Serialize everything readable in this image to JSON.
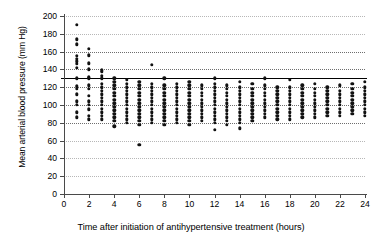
{
  "chart_data": {
    "type": "scatter",
    "title": "",
    "xlabel": "Time after initiation of antihypertensive treatment (hours)",
    "ylabel": "Mean arterial blood pressure (mm Hg)",
    "xlim": [
      0,
      24
    ],
    "ylim": [
      0,
      200
    ],
    "xticks": [
      0,
      2,
      4,
      6,
      8,
      10,
      12,
      14,
      16,
      18,
      20,
      22,
      24
    ],
    "yticks": [
      0,
      20,
      40,
      60,
      80,
      100,
      120,
      140,
      160,
      180,
      200
    ],
    "grid": "horizontal-dotted",
    "legend": "none",
    "reference_line": {
      "y": 130,
      "style": "solid",
      "color": "#000000"
    },
    "marker": {
      "shape": "circle",
      "color": "#111111",
      "size": 3.4
    },
    "series": [
      {
        "name": "Mean arterial blood pressure measurements",
        "points": [
          [
            1,
            190
          ],
          [
            1,
            174
          ],
          [
            1,
            168
          ],
          [
            1,
            155
          ],
          [
            1,
            152
          ],
          [
            1,
            149
          ],
          [
            1,
            146
          ],
          [
            1,
            142
          ],
          [
            1,
            130
          ],
          [
            1,
            121
          ],
          [
            1,
            118
          ],
          [
            1,
            112
          ],
          [
            1,
            104
          ],
          [
            1,
            100
          ],
          [
            1,
            92
          ],
          [
            1,
            86
          ],
          [
            2,
            163
          ],
          [
            2,
            156
          ],
          [
            2,
            147
          ],
          [
            2,
            140
          ],
          [
            2,
            131
          ],
          [
            2,
            130
          ],
          [
            2,
            122
          ],
          [
            2,
            118
          ],
          [
            2,
            110
          ],
          [
            2,
            104
          ],
          [
            2,
            100
          ],
          [
            2,
            95
          ],
          [
            2,
            88
          ],
          [
            2,
            84
          ],
          [
            3,
            139
          ],
          [
            3,
            137
          ],
          [
            3,
            133
          ],
          [
            3,
            130
          ],
          [
            3,
            124
          ],
          [
            3,
            120
          ],
          [
            3,
            116
          ],
          [
            3,
            112
          ],
          [
            3,
            108
          ],
          [
            3,
            104
          ],
          [
            3,
            100
          ],
          [
            3,
            96
          ],
          [
            3,
            92
          ],
          [
            3,
            88
          ],
          [
            3,
            84
          ],
          [
            4,
            130
          ],
          [
            4,
            126
          ],
          [
            4,
            122
          ],
          [
            4,
            118
          ],
          [
            4,
            114
          ],
          [
            4,
            110
          ],
          [
            4,
            106
          ],
          [
            4,
            102
          ],
          [
            4,
            98
          ],
          [
            4,
            94
          ],
          [
            4,
            90
          ],
          [
            4,
            86
          ],
          [
            4,
            82
          ],
          [
            4,
            76
          ],
          [
            5,
            128
          ],
          [
            5,
            124
          ],
          [
            5,
            120
          ],
          [
            5,
            116
          ],
          [
            5,
            112
          ],
          [
            5,
            108
          ],
          [
            5,
            104
          ],
          [
            5,
            100
          ],
          [
            5,
            96
          ],
          [
            5,
            92
          ],
          [
            5,
            88
          ],
          [
            5,
            84
          ],
          [
            5,
            80
          ],
          [
            6,
            126
          ],
          [
            6,
            122
          ],
          [
            6,
            118
          ],
          [
            6,
            114
          ],
          [
            6,
            110
          ],
          [
            6,
            106
          ],
          [
            6,
            102
          ],
          [
            6,
            98
          ],
          [
            6,
            94
          ],
          [
            6,
            90
          ],
          [
            6,
            86
          ],
          [
            6,
            82
          ],
          [
            6,
            78
          ],
          [
            6,
            55
          ],
          [
            7,
            145
          ],
          [
            7,
            124
          ],
          [
            7,
            120
          ],
          [
            7,
            116
          ],
          [
            7,
            112
          ],
          [
            7,
            108
          ],
          [
            7,
            104
          ],
          [
            7,
            100
          ],
          [
            7,
            96
          ],
          [
            7,
            92
          ],
          [
            7,
            88
          ],
          [
            7,
            84
          ],
          [
            7,
            80
          ],
          [
            8,
            130
          ],
          [
            8,
            122
          ],
          [
            8,
            118
          ],
          [
            8,
            114
          ],
          [
            8,
            110
          ],
          [
            8,
            106
          ],
          [
            8,
            102
          ],
          [
            8,
            98
          ],
          [
            8,
            94
          ],
          [
            8,
            90
          ],
          [
            8,
            86
          ],
          [
            8,
            82
          ],
          [
            8,
            78
          ],
          [
            9,
            124
          ],
          [
            9,
            120
          ],
          [
            9,
            116
          ],
          [
            9,
            112
          ],
          [
            9,
            108
          ],
          [
            9,
            104
          ],
          [
            9,
            100
          ],
          [
            9,
            96
          ],
          [
            9,
            92
          ],
          [
            9,
            88
          ],
          [
            9,
            84
          ],
          [
            9,
            80
          ],
          [
            10,
            126
          ],
          [
            10,
            122
          ],
          [
            10,
            118
          ],
          [
            10,
            114
          ],
          [
            10,
            110
          ],
          [
            10,
            106
          ],
          [
            10,
            102
          ],
          [
            10,
            98
          ],
          [
            10,
            94
          ],
          [
            10,
            90
          ],
          [
            10,
            86
          ],
          [
            10,
            82
          ],
          [
            10,
            78
          ],
          [
            11,
            122
          ],
          [
            11,
            118
          ],
          [
            11,
            114
          ],
          [
            11,
            110
          ],
          [
            11,
            106
          ],
          [
            11,
            102
          ],
          [
            11,
            98
          ],
          [
            11,
            94
          ],
          [
            11,
            90
          ],
          [
            11,
            86
          ],
          [
            11,
            82
          ],
          [
            12,
            130
          ],
          [
            12,
            124
          ],
          [
            12,
            120
          ],
          [
            12,
            116
          ],
          [
            12,
            112
          ],
          [
            12,
            108
          ],
          [
            12,
            104
          ],
          [
            12,
            100
          ],
          [
            12,
            96
          ],
          [
            12,
            92
          ],
          [
            12,
            88
          ],
          [
            12,
            84
          ],
          [
            12,
            80
          ],
          [
            12,
            72
          ],
          [
            13,
            122
          ],
          [
            13,
            118
          ],
          [
            13,
            114
          ],
          [
            13,
            110
          ],
          [
            13,
            106
          ],
          [
            13,
            102
          ],
          [
            13,
            98
          ],
          [
            13,
            94
          ],
          [
            13,
            90
          ],
          [
            13,
            86
          ],
          [
            13,
            82
          ],
          [
            13,
            78
          ],
          [
            14,
            126
          ],
          [
            14,
            120
          ],
          [
            14,
            116
          ],
          [
            14,
            112
          ],
          [
            14,
            108
          ],
          [
            14,
            104
          ],
          [
            14,
            100
          ],
          [
            14,
            96
          ],
          [
            14,
            92
          ],
          [
            14,
            88
          ],
          [
            14,
            84
          ],
          [
            14,
            80
          ],
          [
            14,
            74
          ],
          [
            15,
            124
          ],
          [
            15,
            118
          ],
          [
            15,
            114
          ],
          [
            15,
            110
          ],
          [
            15,
            106
          ],
          [
            15,
            102
          ],
          [
            15,
            98
          ],
          [
            15,
            94
          ],
          [
            15,
            90
          ],
          [
            15,
            86
          ],
          [
            15,
            82
          ],
          [
            16,
            130
          ],
          [
            16,
            122
          ],
          [
            16,
            118
          ],
          [
            16,
            114
          ],
          [
            16,
            110
          ],
          [
            16,
            106
          ],
          [
            16,
            102
          ],
          [
            16,
            98
          ],
          [
            16,
            94
          ],
          [
            16,
            90
          ],
          [
            16,
            86
          ],
          [
            17,
            120
          ],
          [
            17,
            116
          ],
          [
            17,
            112
          ],
          [
            17,
            108
          ],
          [
            17,
            104
          ],
          [
            17,
            100
          ],
          [
            17,
            96
          ],
          [
            17,
            92
          ],
          [
            17,
            88
          ],
          [
            17,
            84
          ],
          [
            18,
            128
          ],
          [
            18,
            120
          ],
          [
            18,
            116
          ],
          [
            18,
            112
          ],
          [
            18,
            108
          ],
          [
            18,
            104
          ],
          [
            18,
            100
          ],
          [
            18,
            96
          ],
          [
            18,
            92
          ],
          [
            18,
            88
          ],
          [
            18,
            84
          ],
          [
            19,
            122
          ],
          [
            19,
            118
          ],
          [
            19,
            114
          ],
          [
            19,
            110
          ],
          [
            19,
            106
          ],
          [
            19,
            102
          ],
          [
            19,
            98
          ],
          [
            19,
            94
          ],
          [
            19,
            90
          ],
          [
            19,
            86
          ],
          [
            20,
            124
          ],
          [
            20,
            118
          ],
          [
            20,
            114
          ],
          [
            20,
            110
          ],
          [
            20,
            106
          ],
          [
            20,
            102
          ],
          [
            20,
            98
          ],
          [
            20,
            94
          ],
          [
            20,
            90
          ],
          [
            20,
            86
          ],
          [
            21,
            120
          ],
          [
            21,
            116
          ],
          [
            21,
            112
          ],
          [
            21,
            108
          ],
          [
            21,
            104
          ],
          [
            21,
            100
          ],
          [
            21,
            96
          ],
          [
            21,
            92
          ],
          [
            21,
            88
          ],
          [
            22,
            122
          ],
          [
            22,
            116
          ],
          [
            22,
            112
          ],
          [
            22,
            108
          ],
          [
            22,
            104
          ],
          [
            22,
            100
          ],
          [
            22,
            96
          ],
          [
            22,
            92
          ],
          [
            22,
            88
          ],
          [
            23,
            124
          ],
          [
            23,
            118
          ],
          [
            23,
            114
          ],
          [
            23,
            110
          ],
          [
            23,
            106
          ],
          [
            23,
            102
          ],
          [
            23,
            98
          ],
          [
            23,
            94
          ],
          [
            23,
            90
          ],
          [
            24,
            126
          ],
          [
            24,
            120
          ],
          [
            24,
            116
          ],
          [
            24,
            112
          ],
          [
            24,
            108
          ],
          [
            24,
            104
          ],
          [
            24,
            100
          ],
          [
            24,
            96
          ],
          [
            24,
            92
          ],
          [
            24,
            88
          ]
        ]
      }
    ]
  }
}
